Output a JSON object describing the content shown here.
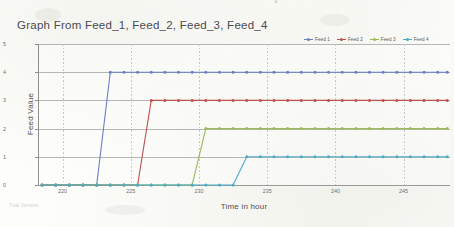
{
  "chart_data": {
    "type": "line",
    "title": "Graph From Feed_1, Feed_2, Feed_3, Feed_4",
    "xlabel": "Time in hour",
    "ylabel": "Feed Value",
    "xlim": [
      218.2,
      248.4
    ],
    "ylim": [
      0,
      5
    ],
    "xticks": [
      220,
      225,
      230,
      235,
      240,
      245
    ],
    "yticks": [
      0,
      1,
      2,
      3,
      4,
      5
    ],
    "grid": "horizontal-solid-and-vertical-dotted",
    "legend_position": "top-right",
    "marker": "circle",
    "step_style": "linear-ramp-between-samples",
    "series": [
      {
        "name": "Feed 1",
        "color": "#6a7fc4",
        "step_time": 223.5,
        "low_value": 0,
        "high_value": 4,
        "x": [
          218.5,
          219.5,
          220.5,
          221.5,
          222.5,
          223.5,
          224.5,
          225.5,
          226.5,
          227.5,
          228.5,
          229.5,
          230.5,
          231.5,
          232.5,
          233.5,
          234.5,
          235.5,
          236.5,
          237.5,
          238.5,
          239.5,
          240.5,
          241.5,
          242.5,
          243.5,
          244.5,
          245.5,
          246.5,
          247.5,
          248.2
        ],
        "y": [
          0,
          0,
          0,
          0,
          0,
          4,
          4,
          4,
          4,
          4,
          4,
          4,
          4,
          4,
          4,
          4,
          4,
          4,
          4,
          4,
          4,
          4,
          4,
          4,
          4,
          4,
          4,
          4,
          4,
          4,
          4
        ]
      },
      {
        "name": "Feed 2",
        "color": "#c0504d",
        "step_time": 226.5,
        "low_value": 0,
        "high_value": 3,
        "x": [
          218.5,
          219.5,
          220.5,
          221.5,
          222.5,
          223.5,
          224.5,
          225.5,
          226.5,
          227.5,
          228.5,
          229.5,
          230.5,
          231.5,
          232.5,
          233.5,
          234.5,
          235.5,
          236.5,
          237.5,
          238.5,
          239.5,
          240.5,
          241.5,
          242.5,
          243.5,
          244.5,
          245.5,
          246.5,
          247.5,
          248.2
        ],
        "y": [
          0,
          0,
          0,
          0,
          0,
          0,
          0,
          0,
          3,
          3,
          3,
          3,
          3,
          3,
          3,
          3,
          3,
          3,
          3,
          3,
          3,
          3,
          3,
          3,
          3,
          3,
          3,
          3,
          3,
          3,
          3
        ]
      },
      {
        "name": "Feed 3",
        "color": "#9bbb59",
        "step_time": 230.5,
        "low_value": 0,
        "high_value": 2,
        "x": [
          218.5,
          219.5,
          220.5,
          221.5,
          222.5,
          223.5,
          224.5,
          225.5,
          226.5,
          227.5,
          228.5,
          229.5,
          230.5,
          231.5,
          232.5,
          233.5,
          234.5,
          235.5,
          236.5,
          237.5,
          238.5,
          239.5,
          240.5,
          241.5,
          242.5,
          243.5,
          244.5,
          245.5,
          246.5,
          247.5,
          248.2
        ],
        "y": [
          0,
          0,
          0,
          0,
          0,
          0,
          0,
          0,
          0,
          0,
          0,
          0,
          2,
          2,
          2,
          2,
          2,
          2,
          2,
          2,
          2,
          2,
          2,
          2,
          2,
          2,
          2,
          2,
          2,
          2,
          2
        ]
      },
      {
        "name": "Feed 4",
        "color": "#4bacc6",
        "step_time": 233.5,
        "low_value": 0,
        "high_value": 1,
        "x": [
          218.5,
          219.5,
          220.5,
          221.5,
          222.5,
          223.5,
          224.5,
          225.5,
          226.5,
          227.5,
          228.5,
          229.5,
          230.5,
          231.5,
          232.5,
          233.5,
          234.5,
          235.5,
          236.5,
          237.5,
          238.5,
          239.5,
          240.5,
          241.5,
          242.5,
          243.5,
          244.5,
          245.5,
          246.5,
          247.5,
          248.2
        ],
        "y": [
          0,
          0,
          0,
          0,
          0,
          0,
          0,
          0,
          0,
          0,
          0,
          0,
          0,
          0,
          0,
          1,
          1,
          1,
          1,
          1,
          1,
          1,
          1,
          1,
          1,
          1,
          1,
          1,
          1,
          1,
          1
        ]
      }
    ]
  },
  "watermarks": {
    "trial": "Trial Version",
    "scan_edge": "scanned"
  }
}
